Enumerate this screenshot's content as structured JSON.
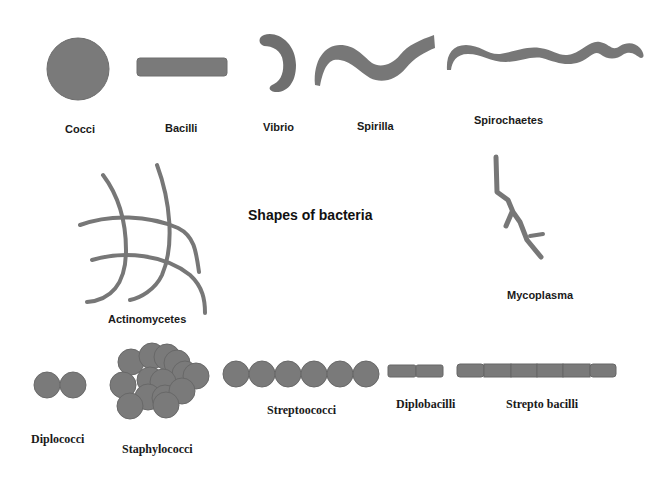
{
  "title": "Shapes of bacteria",
  "colors": {
    "shape_fill": "#7a7a7a",
    "shape_stroke": "#6a6a6a",
    "text": "#1a1a1a",
    "background": "#ffffff"
  },
  "shapes": {
    "cocci": {
      "label": "Cocci"
    },
    "bacilli": {
      "label": "Bacilli"
    },
    "vibrio": {
      "label": "Vibrio"
    },
    "spirilla": {
      "label": "Spirilla"
    },
    "spirochaetes": {
      "label": "Spirochaetes"
    },
    "actinomycetes": {
      "label": "Actinomycetes"
    },
    "mycoplasma": {
      "label": "Mycoplasma"
    },
    "diplococci": {
      "label": "Diplococci"
    },
    "staphylococci": {
      "label": "Staphylococci"
    },
    "streptococci": {
      "label": "Streptoococci"
    },
    "diplobacilli": {
      "label": "Diplobacilli"
    },
    "streptobacilli": {
      "label": "Strepto bacilli"
    }
  }
}
